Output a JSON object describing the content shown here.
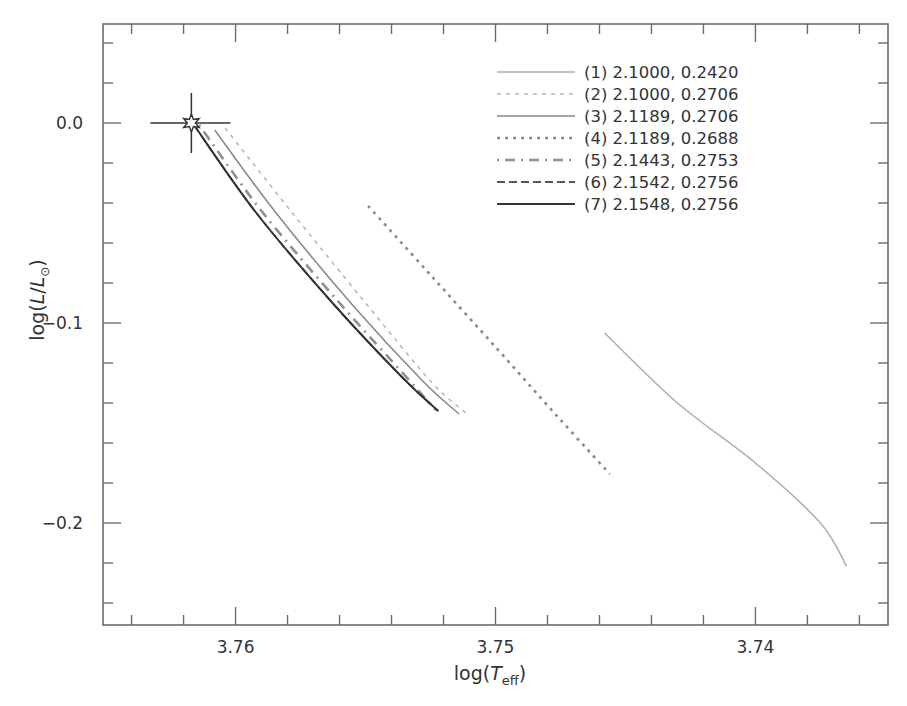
{
  "chart_data": {
    "type": "line",
    "title": "",
    "xlabel": "log(T_eff)",
    "ylabel": "log(L/L_sun)",
    "xlabel_parts": {
      "pre": "log(",
      "italic": "T",
      "sub": "eff",
      "post": ")"
    },
    "ylabel_parts": {
      "pre": "log(",
      "italic1": "L",
      "mid": "/",
      "italic2": "L",
      "sub": "⊙",
      "post": ")"
    },
    "xlim": [
      3.7651,
      3.7349
    ],
    "ylim": [
      -0.251,
      0.0495
    ],
    "x_reversed": true,
    "x_major_ticks": [
      3.76,
      3.75,
      3.74
    ],
    "x_tick_labels": [
      "3.76",
      "3.75",
      "3.74"
    ],
    "x_minor_step": 0.002,
    "y_major_ticks": [
      0.0,
      -0.1,
      -0.2
    ],
    "y_tick_labels": [
      "0.0",
      "−0.1",
      "−0.2"
    ],
    "y_minor_step": 0.02,
    "grid": false,
    "legend_position": "upper right",
    "sun_marker": {
      "x": 3.7617,
      "y": 0.0,
      "xerr": 0.0015,
      "yerr": 0.0115,
      "symbol": "star"
    },
    "series": [
      {
        "name": "(1) 2.1000, 0.2420",
        "style": "solid",
        "color": "#b0b0b0",
        "width": 1.6,
        "x": [
          3.7458,
          3.743,
          3.74,
          3.7375,
          3.7365
        ],
        "y": [
          -0.105,
          -0.14,
          -0.17,
          -0.2,
          -0.2215
        ]
      },
      {
        "name": "(2) 2.1000, 0.2706",
        "style": "dashed-light",
        "color": "#b8b8b8",
        "width": 1.6,
        "x": [
          3.7604,
          3.758,
          3.755,
          3.7525,
          3.7511
        ],
        "y": [
          -0.0025,
          -0.042,
          -0.09,
          -0.129,
          -0.1455
        ]
      },
      {
        "name": "(3) 2.1189, 0.2706",
        "style": "solid",
        "color": "#8a8a8a",
        "width": 1.6,
        "x": [
          3.7608,
          3.7585,
          3.7555,
          3.7528,
          3.7514
        ],
        "y": [
          -0.0035,
          -0.044,
          -0.091,
          -0.129,
          -0.1455
        ]
      },
      {
        "name": "(4) 2.1189, 0.2688",
        "style": "dotted",
        "color": "#8a8a8a",
        "width": 2.6,
        "x": [
          3.7549,
          3.7525,
          3.75,
          3.7476,
          3.7456
        ],
        "y": [
          -0.0415,
          -0.076,
          -0.112,
          -0.147,
          -0.1755
        ]
      },
      {
        "name": "(5) 2.1443, 0.2753",
        "style": "dashdot",
        "color": "#8f8f8f",
        "width": 2.6,
        "x": [
          3.7614,
          3.759,
          3.756,
          3.7535,
          3.7523
        ],
        "y": [
          -0.001,
          -0.044,
          -0.09,
          -0.126,
          -0.1435
        ]
      },
      {
        "name": "(6) 2.1542, 0.2756",
        "style": "dashed",
        "color": "#555555",
        "width": 1.8,
        "x": [
          3.7616,
          3.7592,
          3.7562,
          3.7536,
          3.7522
        ],
        "y": [
          -0.001,
          -0.045,
          -0.091,
          -0.127,
          -0.144
        ]
      },
      {
        "name": "(7) 2.1548, 0.2756",
        "style": "solid",
        "color": "#333333",
        "width": 2.0,
        "x": [
          3.7616,
          3.7592,
          3.7562,
          3.7536,
          3.7522
        ],
        "y": [
          -0.001,
          -0.045,
          -0.091,
          -0.127,
          -0.144
        ]
      }
    ]
  },
  "legend": {
    "items": [
      {
        "label": "(1) 2.1000, 0.2420"
      },
      {
        "label": "(2) 2.1000, 0.2706"
      },
      {
        "label": "(3) 2.1189, 0.2706"
      },
      {
        "label": "(4) 2.1189, 0.2688"
      },
      {
        "label": "(5) 2.1443, 0.2753"
      },
      {
        "label": "(6) 2.1542, 0.2756"
      },
      {
        "label": "(7) 2.1548, 0.2756"
      }
    ]
  }
}
